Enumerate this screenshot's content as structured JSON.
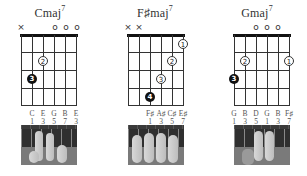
{
  "chords": [
    {
      "name": "Cmaj",
      "superscript": "7",
      "string_markers": [
        "×",
        "",
        "",
        "o",
        "o",
        "o"
      ],
      "fingers": [
        {
          "string": 5,
          "fret": 2,
          "finger": "2",
          "style": "open"
        },
        {
          "string": 6,
          "fret": 3,
          "finger": "3",
          "style": "filled"
        }
      ],
      "notes": [
        "C",
        "E",
        "G",
        "B",
        "E"
      ],
      "intervals": [
        "1",
        "3",
        "5",
        "7",
        "3"
      ],
      "note_start_string": 2
    },
    {
      "name": "F♯maj",
      "superscript": "7",
      "string_markers": [
        "×",
        "×",
        "",
        "",
        "",
        ""
      ],
      "fingers": [
        {
          "string": 1,
          "fret": 1,
          "finger": "1",
          "style": "open"
        },
        {
          "string": 2,
          "fret": 2,
          "finger": "2",
          "style": "open"
        },
        {
          "string": 3,
          "fret": 3,
          "finger": "3",
          "style": "open"
        },
        {
          "string": 4,
          "fret": 4,
          "finger": "4",
          "style": "filled"
        }
      ],
      "notes": [
        "F♯",
        "A♯",
        "C♯",
        "E♯"
      ],
      "intervals": [
        "1",
        "3",
        "5",
        "7"
      ],
      "note_start_string": 3
    },
    {
      "name": "Gmaj",
      "superscript": "7",
      "string_markers": [
        "",
        "",
        "o",
        "o",
        "o",
        ""
      ],
      "fingers": [
        {
          "string": 5,
          "fret": 2,
          "finger": "2",
          "style": "open"
        },
        {
          "string": 1,
          "fret": 2,
          "finger": "1",
          "style": "open"
        },
        {
          "string": 6,
          "fret": 3,
          "finger": "3",
          "style": "filled"
        }
      ],
      "notes": [
        "G",
        "B",
        "D",
        "G",
        "B",
        "F♯"
      ],
      "intervals": [
        "1",
        "3",
        "5",
        "1",
        "3",
        "7"
      ],
      "note_start_string": 1
    }
  ]
}
